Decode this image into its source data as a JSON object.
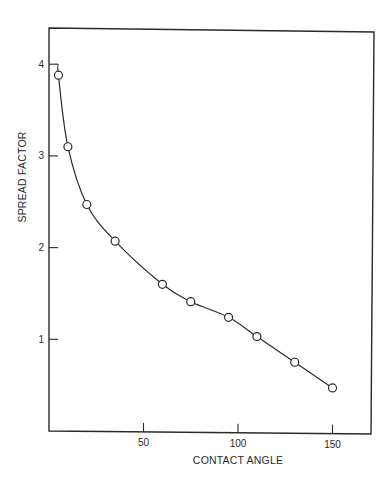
{
  "chart_data": {
    "type": "line",
    "title": "",
    "xlabel": "CONTACT ANGLE",
    "ylabel": "SPREAD FACTOR",
    "xlim": [
      0,
      170
    ],
    "ylim": [
      0,
      4.3
    ],
    "grid": false,
    "legend": null,
    "x_ticks": [
      50,
      100,
      150
    ],
    "y_ticks": [
      1,
      2,
      3,
      4
    ],
    "x_tick_labels": [
      "50",
      "100",
      "150"
    ],
    "y_tick_labels": [
      "1",
      "2",
      "3",
      "4"
    ],
    "series": [
      {
        "name": "Spread factor vs contact angle",
        "marker": "open-circle",
        "line": "smooth-curve",
        "x": [
          5,
          10,
          20,
          35,
          60,
          75,
          95,
          110,
          130,
          150
        ],
        "y": [
          3.88,
          3.1,
          2.47,
          2.07,
          1.6,
          1.41,
          1.24,
          1.03,
          0.75,
          0.47
        ]
      }
    ],
    "annotations": [
      "Curve begins at spread factor 4 on the y-axis"
    ]
  },
  "colors": {
    "background": "#ffffff",
    "ink": "#2a2a2a"
  }
}
